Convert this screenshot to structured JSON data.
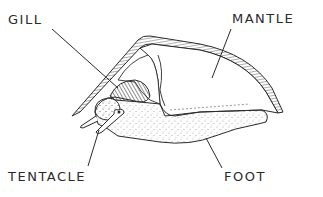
{
  "diagram": {
    "labels": {
      "gill": "GILL",
      "mantle": "MANTLE",
      "tentacle": "TENTACLE",
      "foot": "FOOT"
    },
    "colors": {
      "ink": "#2a2a2a",
      "background": "#ffffff"
    }
  }
}
